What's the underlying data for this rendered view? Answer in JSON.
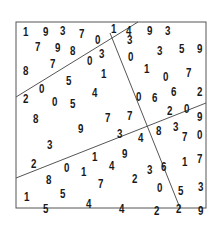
{
  "puzzle": {
    "frame": {
      "x": 16,
      "y": 22,
      "w": 190,
      "h": 186,
      "color": "#555555"
    },
    "lines": [
      {
        "x1": 16,
        "y1": 97,
        "x2": 138,
        "y2": 22
      },
      {
        "x1": 110,
        "y1": 33,
        "x2": 180,
        "y2": 208
      },
      {
        "x1": 16,
        "y1": 178,
        "x2": 206,
        "y2": 103
      }
    ],
    "digits": [
      {
        "v": "1",
        "x": 22,
        "y": 25
      },
      {
        "v": "9",
        "x": 42,
        "y": 25
      },
      {
        "v": "3",
        "x": 59,
        "y": 24
      },
      {
        "v": "7",
        "x": 78,
        "y": 27
      },
      {
        "v": "0",
        "x": 94,
        "y": 33
      },
      {
        "v": "1",
        "x": 110,
        "y": 22
      },
      {
        "v": "7",
        "x": 34,
        "y": 40
      },
      {
        "v": "9",
        "x": 54,
        "y": 41
      },
      {
        "v": "8",
        "x": 69,
        "y": 44
      },
      {
        "v": "0",
        "x": 86,
        "y": 54
      },
      {
        "v": "3",
        "x": 98,
        "y": 47
      },
      {
        "v": "8",
        "x": 22,
        "y": 64
      },
      {
        "v": "7",
        "x": 49,
        "y": 57
      },
      {
        "v": "1",
        "x": 100,
        "y": 67
      },
      {
        "v": "5",
        "x": 65,
        "y": 74
      },
      {
        "v": "0",
        "x": 38,
        "y": 82
      },
      {
        "v": "4",
        "x": 91,
        "y": 86
      },
      {
        "v": "2",
        "x": 22,
        "y": 92
      },
      {
        "v": "0",
        "x": 51,
        "y": 95
      },
      {
        "v": "5",
        "x": 69,
        "y": 97
      },
      {
        "v": "8",
        "x": 32,
        "y": 112
      },
      {
        "v": "9",
        "x": 77,
        "y": 122
      },
      {
        "v": "7",
        "x": 104,
        "y": 111
      },
      {
        "v": "7",
        "x": 126,
        "y": 109
      },
      {
        "v": "3",
        "x": 46,
        "y": 138
      },
      {
        "v": "2",
        "x": 30,
        "y": 157
      },
      {
        "v": "0",
        "x": 63,
        "y": 161
      },
      {
        "v": "1",
        "x": 91,
        "y": 150
      },
      {
        "v": "3",
        "x": 116,
        "y": 127
      },
      {
        "v": "4",
        "x": 137,
        "y": 131
      },
      {
        "v": "9",
        "x": 121,
        "y": 147
      },
      {
        "v": "4",
        "x": 108,
        "y": 159
      },
      {
        "v": "8",
        "x": 45,
        "y": 173
      },
      {
        "v": "1",
        "x": 80,
        "y": 165
      },
      {
        "v": "7",
        "x": 97,
        "y": 177
      },
      {
        "v": "1",
        "x": 23,
        "y": 190
      },
      {
        "v": "5",
        "x": 59,
        "y": 187
      },
      {
        "v": "5",
        "x": 42,
        "y": 202
      },
      {
        "v": "4",
        "x": 85,
        "y": 197
      },
      {
        "v": "4",
        "x": 118,
        "y": 202
      },
      {
        "v": "2",
        "x": 131,
        "y": 172
      },
      {
        "v": "3",
        "x": 146,
        "y": 163
      },
      {
        "v": "4",
        "x": 125,
        "y": 24
      },
      {
        "v": "9",
        "x": 146,
        "y": 24
      },
      {
        "v": "3",
        "x": 164,
        "y": 24
      },
      {
        "v": "3",
        "x": 126,
        "y": 33
      },
      {
        "v": "0",
        "x": 127,
        "y": 50
      },
      {
        "v": "3",
        "x": 156,
        "y": 44
      },
      {
        "v": "5",
        "x": 178,
        "y": 42
      },
      {
        "v": "9",
        "x": 196,
        "y": 42
      },
      {
        "v": "1",
        "x": 143,
        "y": 62
      },
      {
        "v": "0",
        "x": 162,
        "y": 70
      },
      {
        "v": "7",
        "x": 185,
        "y": 66
      },
      {
        "v": "0",
        "x": 135,
        "y": 90
      },
      {
        "v": "6",
        "x": 151,
        "y": 91
      },
      {
        "v": "6",
        "x": 170,
        "y": 85
      },
      {
        "v": "2",
        "x": 196,
        "y": 85
      },
      {
        "v": "2",
        "x": 166,
        "y": 104
      },
      {
        "v": "0",
        "x": 183,
        "y": 102
      },
      {
        "v": "9",
        "x": 196,
        "y": 110
      },
      {
        "v": "8",
        "x": 155,
        "y": 124
      },
      {
        "v": "3",
        "x": 172,
        "y": 120
      },
      {
        "v": "7",
        "x": 181,
        "y": 130
      },
      {
        "v": "0",
        "x": 196,
        "y": 128
      },
      {
        "v": "6",
        "x": 160,
        "y": 160
      },
      {
        "v": "1",
        "x": 181,
        "y": 155
      },
      {
        "v": "7",
        "x": 196,
        "y": 152
      },
      {
        "v": "0",
        "x": 156,
        "y": 181
      },
      {
        "v": "5",
        "x": 177,
        "y": 184
      },
      {
        "v": "3",
        "x": 197,
        "y": 180
      },
      {
        "v": "2",
        "x": 153,
        "y": 204
      },
      {
        "v": "2",
        "x": 175,
        "y": 202
      },
      {
        "v": "9",
        "x": 197,
        "y": 204
      }
    ]
  }
}
